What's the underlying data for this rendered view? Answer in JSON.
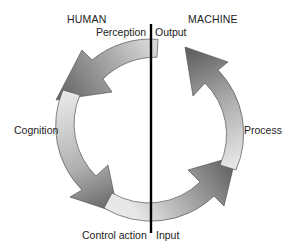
{
  "diagram": {
    "type": "cycle",
    "flow_direction": "counterclockwise",
    "sides": {
      "left": "HUMAN",
      "right": "MACHINE"
    },
    "labels": {
      "perception": "Perception",
      "output": "Output",
      "cognition": "Cognition",
      "process": "Process",
      "control_action": "Control action",
      "input": "Input"
    },
    "stages": [
      {
        "from": "Perception",
        "to": "Cognition",
        "side": "HUMAN"
      },
      {
        "from": "Cognition",
        "to": "Control action",
        "side": "HUMAN"
      },
      {
        "from": "Input",
        "to": "Process",
        "side": "MACHINE"
      },
      {
        "from": "Process",
        "to": "Output",
        "side": "MACHINE"
      }
    ],
    "colors": {
      "arrow_light": "#ececec",
      "arrow_dark": "#6e6e6e",
      "divider": "#000000",
      "text": "#222222"
    }
  }
}
